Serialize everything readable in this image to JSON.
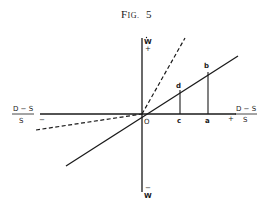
{
  "figure": {
    "title_prefix": "F",
    "title_smallcaps": "IG.",
    "title_number": "5"
  },
  "axes": {
    "vertical_top_label": "W",
    "vertical_top_sign": "+",
    "vertical_bottom_sign": "−",
    "vertical_bottom_label": "W",
    "horizontal_left_num": "D − S",
    "horizontal_left_den": "S",
    "horizontal_left_sign": "−",
    "horizontal_right_num": "D − S",
    "horizontal_right_den": "S",
    "horizontal_right_sign": "+",
    "origin_label": "O"
  },
  "points": {
    "a": "a",
    "b": "b",
    "c": "c",
    "d": "d"
  },
  "lines": [
    {
      "name": "solid-line",
      "style": "solid"
    },
    {
      "name": "steep-dashed-line",
      "style": "dashed"
    },
    {
      "name": "shallow-dashed-line",
      "style": "dashed"
    }
  ]
}
